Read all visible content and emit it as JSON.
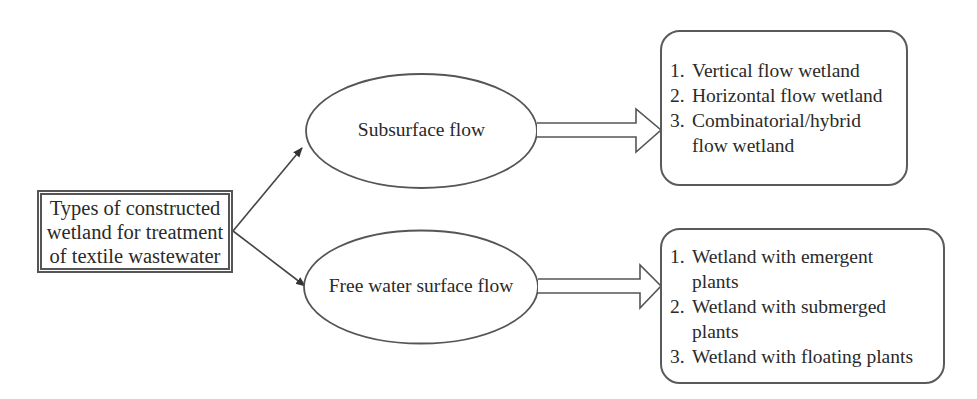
{
  "root": {
    "lines": [
      "Types of constructed",
      "wetland for treatment",
      "of textile wastewater"
    ]
  },
  "branches": [
    {
      "label": "Subsurface flow",
      "items": [
        {
          "num": "1.",
          "text": "Vertical flow wetland"
        },
        {
          "num": "2.",
          "text": "Horizontal flow wetland"
        },
        {
          "num": "3.",
          "text": "Combinatorial/hybrid flow wetland"
        }
      ]
    },
    {
      "label": "Free water surface flow",
      "items": [
        {
          "num": "1.",
          "text": "Wetland with emergent plants"
        },
        {
          "num": "2.",
          "text": "Wetland with submerged plants"
        },
        {
          "num": "3.",
          "text": "Wetland with floating plants"
        }
      ]
    }
  ],
  "colors": {
    "stroke": "#4a4a4a",
    "text": "#2a2a2a",
    "background": "#ffffff"
  }
}
